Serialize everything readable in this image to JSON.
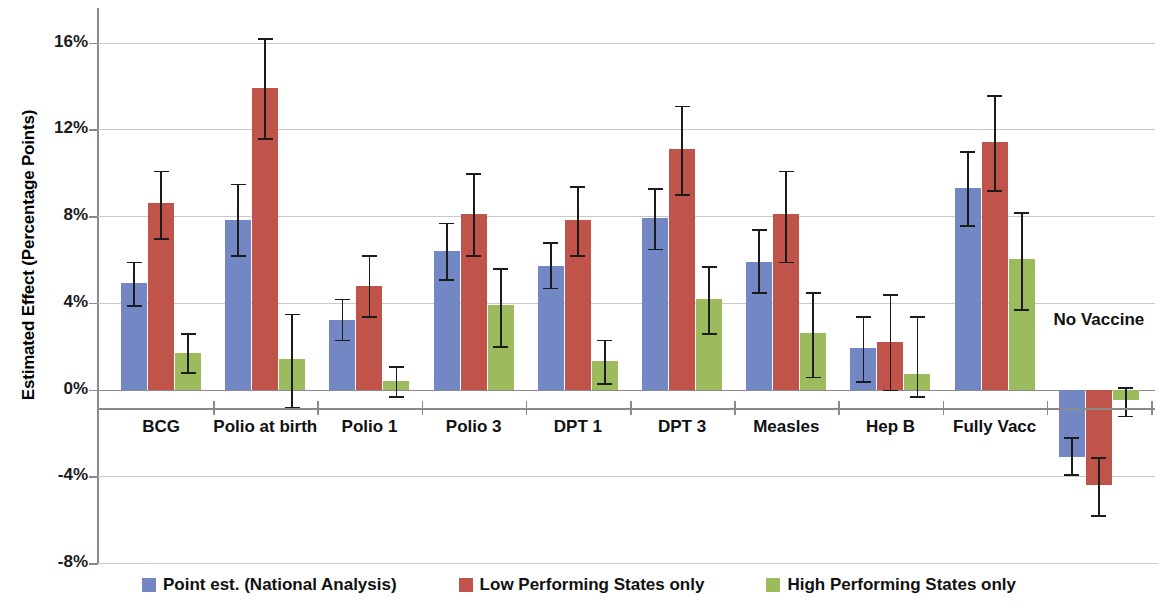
{
  "chart_data": {
    "type": "bar",
    "title": "",
    "subtitle": "",
    "xlabel": "",
    "ylabel": "Estimated Effect (Percentage Points)",
    "ylim": [
      -8,
      17.6
    ],
    "ytick_labels": [
      "16%",
      "12%",
      "8%",
      "4%",
      "0%",
      "-4%",
      "-8%"
    ],
    "ytick_values": [
      16,
      12,
      8,
      4,
      0,
      -4,
      -8
    ],
    "grid": true,
    "legend_position": "bottom",
    "orientation": "vertical",
    "error_bars": true,
    "categories": [
      "BCG",
      "Polio at birth",
      "Polio 1",
      "Polio 3",
      "DPT 1",
      "DPT 3",
      "Measles",
      "Hep B",
      "Fully Vacc",
      "No Vaccine"
    ],
    "series": [
      {
        "name": "Point est. (National Analysis)",
        "color": "#7287c4",
        "values": [
          4.9,
          7.8,
          3.2,
          6.4,
          5.7,
          7.9,
          5.9,
          1.9,
          9.3,
          -3.1
        ],
        "err_low": [
          3.9,
          6.2,
          2.3,
          5.1,
          4.7,
          6.5,
          4.5,
          0.4,
          7.6,
          -3.9
        ],
        "err_high": [
          5.9,
          9.5,
          4.2,
          7.7,
          6.8,
          9.3,
          7.4,
          3.4,
          11.0,
          -2.2
        ]
      },
      {
        "name": "Low Performing States only",
        "color": "#c0544a",
        "values": [
          8.6,
          13.9,
          4.8,
          8.1,
          7.8,
          11.1,
          8.1,
          2.2,
          11.4,
          -4.4
        ],
        "err_low": [
          7.0,
          11.6,
          3.4,
          6.2,
          6.2,
          9.0,
          5.9,
          0.0,
          9.2,
          -5.8
        ],
        "err_high": [
          10.1,
          16.2,
          6.2,
          10.0,
          9.4,
          13.1,
          10.1,
          4.4,
          13.6,
          -3.1
        ]
      },
      {
        "name": "High Performing States only",
        "color": "#9cbb5c",
        "values": [
          1.7,
          1.4,
          0.4,
          3.9,
          1.3,
          4.2,
          2.6,
          0.7,
          6.0,
          -0.5
        ],
        "err_low": [
          0.8,
          -0.8,
          -0.3,
          2.0,
          0.3,
          2.6,
          0.6,
          -0.3,
          3.7,
          -1.2
        ],
        "err_high": [
          2.6,
          3.5,
          1.1,
          5.6,
          2.3,
          5.7,
          4.5,
          3.4,
          8.2,
          0.1
        ]
      }
    ]
  },
  "legend": {
    "entries": [
      {
        "label": "Point est. (National Analysis)",
        "color": "#7287c4"
      },
      {
        "label": "Low Performing States only",
        "color": "#c0544a"
      },
      {
        "label": "High Performing States only",
        "color": "#9cbb5c"
      }
    ]
  },
  "axis": {
    "y_title": "Estimated Effect (Percentage Points)"
  },
  "colors": {
    "series_blue": "#7287c4",
    "series_red": "#c0544a",
    "series_green": "#9cbb5c",
    "grid": "#c9c9c9",
    "axis": "#8a8a8a",
    "text": "#111111",
    "background": "#ffffff"
  }
}
